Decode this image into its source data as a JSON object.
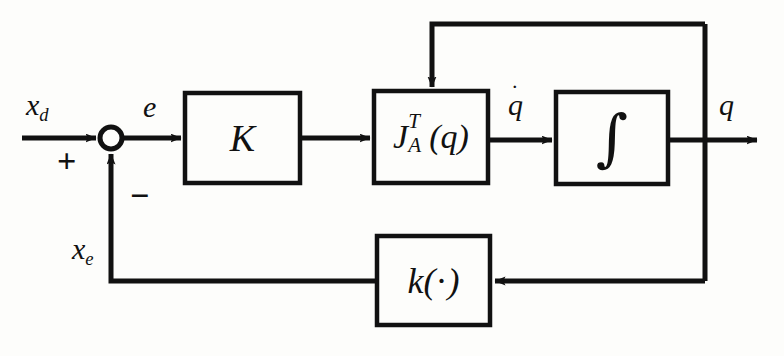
{
  "diagram": {
    "background_color": "#fdfdfb",
    "line_color": "#111111",
    "blocks": [
      {
        "id": "gain",
        "label": "K",
        "x": 185,
        "y": 93,
        "w": 115,
        "h": 90
      },
      {
        "id": "jacobian",
        "label": "J_A^T(q)",
        "x": 374,
        "y": 91,
        "w": 114,
        "h": 92
      },
      {
        "id": "integrator",
        "label": "integral",
        "x": 556,
        "y": 92,
        "w": 112,
        "h": 92
      },
      {
        "id": "feedback",
        "label": "k(.)",
        "x": 377,
        "y": 236,
        "w": 113,
        "h": 89
      }
    ],
    "summing_junction": {
      "cx": 111,
      "cy": 138,
      "r": 11
    },
    "signal_labels": {
      "input": "x",
      "input_sub": "d",
      "error": "e",
      "qdot": "q",
      "qdot_dot": "˙",
      "output": "q",
      "feedback_signal": "x",
      "feedback_signal_sub": "e"
    },
    "signs": {
      "positive": "+",
      "negative": "−"
    },
    "glyphs": {
      "integral": "∫",
      "center_dot": "·",
      "paren_open": "(",
      "paren_close": ")",
      "jacobian_base": "J",
      "jacobian_sup": "T",
      "jacobian_sub": "A",
      "jacobian_arg": "q",
      "feedback_base": "k"
    },
    "paths": [
      {
        "name": "input-to-sum",
        "from": "x_d input",
        "to": "summing junction"
      },
      {
        "name": "sum-to-gain",
        "from": "summing junction",
        "to": "K block"
      },
      {
        "name": "gain-to-jacobian",
        "from": "K block",
        "to": "J_A^T(q) block"
      },
      {
        "name": "jacobian-to-integrator",
        "from": "J_A^T(q) block",
        "to": "integrator block"
      },
      {
        "name": "integrator-to-output",
        "from": "integrator block",
        "to": "q output"
      },
      {
        "name": "top-feedback",
        "from": "q tap",
        "to": "J_A^T(q) top input"
      },
      {
        "name": "bottom-feedback",
        "from": "q tap",
        "to": "k(.) block right input"
      },
      {
        "name": "feedback-to-sum",
        "from": "k(.) block",
        "to": "summing junction negative input"
      }
    ]
  }
}
